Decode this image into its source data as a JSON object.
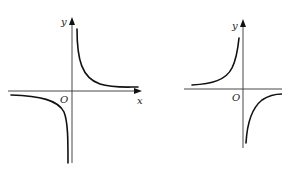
{
  "figure": {
    "graphs": [
      {
        "id": "left",
        "description": "Hyperbola with branches in quadrants I and III",
        "labels": {
          "y_axis": "y",
          "x_axis": "x",
          "origin": "O"
        }
      },
      {
        "id": "right",
        "description": "Hyperbola with branches in quadrants II and IV",
        "labels": {
          "y_axis": "y",
          "origin": "O"
        }
      }
    ],
    "colors": {
      "curve": "#111111",
      "axis": "#333333",
      "background": "#ffffff"
    }
  }
}
